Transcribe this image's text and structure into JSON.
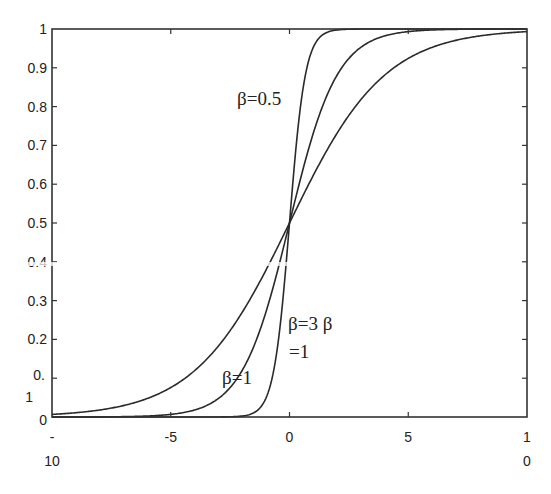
{
  "chart_data": {
    "type": "line",
    "title": "",
    "xlabel": "",
    "ylabel": "",
    "xlim": [
      -10,
      10
    ],
    "ylim": [
      0,
      1
    ],
    "grid": false,
    "legend": "none (inline curve annotations)",
    "function": "logistic sigmoid f(x) = 1 / (1 + exp(-k*x))",
    "x_ticks": [
      -10,
      -5,
      0,
      5,
      10
    ],
    "x_tick_labels": [
      {
        "line1": "-",
        "line2": "10"
      },
      {
        "line1": "-5",
        "line2": ""
      },
      {
        "line1": "0",
        "line2": ""
      },
      {
        "line1": "5",
        "line2": ""
      },
      {
        "line1": "1",
        "line2": "0"
      }
    ],
    "y_ticks": [
      0,
      0.1,
      0.2,
      0.3,
      0.4,
      0.5,
      0.6,
      0.7,
      0.8,
      0.9,
      1
    ],
    "y_tick_labels": [
      {
        "line1": "0",
        "line2": ""
      },
      {
        "line1": "0.",
        "line2": "1"
      },
      {
        "line1": "0.2",
        "line2": ""
      },
      {
        "line1": "0.3",
        "line2": ""
      },
      {
        "line1": "0.4",
        "line2": ""
      },
      {
        "line1": "0.5",
        "line2": ""
      },
      {
        "line1": "0.6",
        "line2": ""
      },
      {
        "line1": "0.7",
        "line2": ""
      },
      {
        "line1": "0.8",
        "line2": ""
      },
      {
        "line1": "0.9",
        "line2": ""
      },
      {
        "line1": "1",
        "line2": ""
      }
    ],
    "series": [
      {
        "name": "steep",
        "k": 3,
        "x": [
          -10,
          -5,
          -2,
          -1,
          0,
          1,
          2,
          5,
          10
        ],
        "values": [
          0.0,
          0.0,
          0.002,
          0.047,
          0.5,
          0.953,
          0.998,
          1.0,
          1.0
        ]
      },
      {
        "name": "medium",
        "k": 1,
        "x": [
          -10,
          -5,
          -2,
          -1,
          0,
          1,
          2,
          5,
          10
        ],
        "values": [
          0.0,
          0.007,
          0.119,
          0.269,
          0.5,
          0.731,
          0.881,
          0.993,
          1.0
        ]
      },
      {
        "name": "shallow",
        "k": 0.5,
        "x": [
          -10,
          -5,
          -2,
          -1,
          0,
          1,
          2,
          5,
          10
        ],
        "values": [
          0.007,
          0.076,
          0.269,
          0.378,
          0.5,
          0.622,
          0.731,
          0.924,
          0.993
        ]
      }
    ],
    "annotations": [
      {
        "text": "β=0.5",
        "x_px": 237,
        "y_px": 105
      },
      {
        "text": "β=3 β",
        "x_px": 288,
        "y_px": 330
      },
      {
        "text": "=1",
        "x_px": 289,
        "y_px": 358
      },
      {
        "text": "β=1",
        "x_px": 222,
        "y_px": 384
      }
    ],
    "colors": {
      "line": "#2a2a2a",
      "frame": "#333333",
      "background": "#ffffff"
    }
  }
}
